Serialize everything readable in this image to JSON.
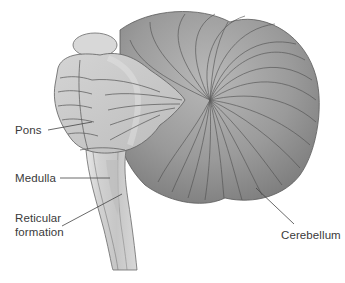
{
  "diagram": {
    "labels": [
      {
        "id": "pons",
        "text": "Pons"
      },
      {
        "id": "medulla",
        "text": "Medulla"
      },
      {
        "id": "reticular-formation",
        "text": "Reticular\nformation",
        "lines": [
          "Reticular",
          "formation"
        ]
      },
      {
        "id": "cerebellum",
        "text": "Cerebellum"
      }
    ],
    "colors": {
      "cerebellum_fill": "#8e8e8e",
      "cerebellum_highlight": "#b4b4b4",
      "brainstem_fill": "#cfcfcf",
      "brainstem_edge": "#e6e6e6",
      "reticular_fill": "#bdbdbd",
      "outline": "#555555",
      "leader_line": "#444444",
      "label_text": "#3a3a3a"
    }
  }
}
